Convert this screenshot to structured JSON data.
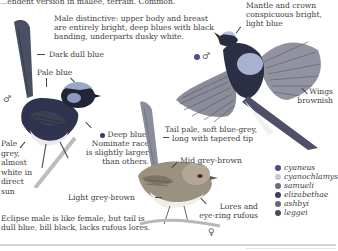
{
  "page": {
    "header_text": "...endent version in mallee, terrain. Common.",
    "male_description": [
      "Male distinctive: upper body and breast",
      "are entirely bright, deep blues with black",
      "banding, underparts dusky white."
    ],
    "mantle_label": [
      "Mantle and crown",
      "conspicuous bright,",
      "light blue"
    ],
    "dark_dull_blue": "Dark dull blue",
    "pale_blue": "Pale blue",
    "wings_label": [
      "Wings",
      "brownish"
    ],
    "pale_grey_label": [
      "Pale",
      "grey,",
      "almost",
      "white in",
      "direct",
      "sun"
    ],
    "deep_blue_label": [
      "Deep blue.",
      "Nominate race",
      "is slightly larger",
      "than others."
    ],
    "tail_label": [
      "Tail pale, soft blue-grey,",
      "long with tapered tip"
    ],
    "mid_grey_brown": "Mid grey-brown",
    "light_grey_brown": "Light grey-brown",
    "lores_label": [
      "Lores and",
      "eye-ring rufous"
    ],
    "eclipse_note": [
      "Eclipse male is like female, but tail is",
      "dull blue, bill black, lacks rufous lores."
    ],
    "male_symbol": "♂",
    "female_symbol": "♀"
  },
  "legend": [
    {
      "name": "cyaneus",
      "color": "#4a4f8c"
    },
    {
      "name": "cyanochlamys",
      "color": "#c9c9d6"
    },
    {
      "name": "samueli",
      "color": "#6b6b7e"
    },
    {
      "name": "elizabethae",
      "color": "#3c3c5c"
    },
    {
      "name": "ashbyi",
      "color": "#6a6478"
    },
    {
      "name": "leggei",
      "color": "#4c4860"
    }
  ],
  "colors": {
    "male_dot": "#4a4f8c",
    "deep_blue_dot": "#3c3c6c"
  }
}
